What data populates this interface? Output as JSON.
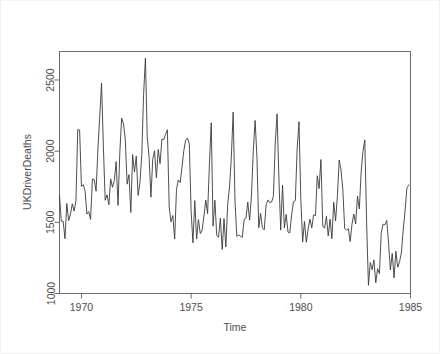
{
  "chart_data": {
    "type": "line",
    "title": "",
    "subtitle": "",
    "xlabel": "Time",
    "ylabel": "UKDriverDeaths",
    "xlim": [
      1969.0,
      1985.0
    ],
    "ylim": [
      1000,
      2700
    ],
    "xticks": [
      1970,
      1975,
      1980,
      1985
    ],
    "xtick_labels": [
      "1970",
      "1975",
      "1980",
      "1985"
    ],
    "yticks": [
      1000,
      1500,
      2000,
      2500
    ],
    "ytick_labels": [
      "1000",
      "1500",
      "2000",
      "2500"
    ],
    "grid": false,
    "legend": null,
    "line_color": "#3a3a3a",
    "frame_color": "#6b6b6b",
    "background_color": "#ffffff",
    "series": [
      {
        "name": "UKDriverDeaths",
        "frequency": "monthly",
        "start": "1969-01",
        "end": "1984-12",
        "n": 192,
        "x": [
          1969.0,
          1969.083,
          1969.167,
          1969.25,
          1969.333,
          1969.417,
          1969.5,
          1969.583,
          1969.667,
          1969.75,
          1969.833,
          1969.917,
          1970.0,
          1970.083,
          1970.167,
          1970.25,
          1970.333,
          1970.417,
          1970.5,
          1970.583,
          1970.667,
          1970.75,
          1970.833,
          1970.917,
          1971.0,
          1971.083,
          1971.167,
          1971.25,
          1971.333,
          1971.417,
          1971.5,
          1971.583,
          1971.667,
          1971.75,
          1971.833,
          1971.917,
          1972.0,
          1972.083,
          1972.167,
          1972.25,
          1972.333,
          1972.417,
          1972.5,
          1972.583,
          1972.667,
          1972.75,
          1972.833,
          1972.917,
          1973.0,
          1973.083,
          1973.167,
          1973.25,
          1973.333,
          1973.417,
          1973.5,
          1973.583,
          1973.667,
          1973.75,
          1973.833,
          1973.917,
          1974.0,
          1974.083,
          1974.167,
          1974.25,
          1974.333,
          1974.417,
          1974.5,
          1974.583,
          1974.667,
          1974.75,
          1974.833,
          1974.917,
          1975.0,
          1975.083,
          1975.167,
          1975.25,
          1975.333,
          1975.417,
          1975.5,
          1975.583,
          1975.667,
          1975.75,
          1975.833,
          1975.917,
          1976.0,
          1976.083,
          1976.167,
          1976.25,
          1976.333,
          1976.417,
          1976.5,
          1976.583,
          1976.667,
          1976.75,
          1976.833,
          1976.917,
          1977.0,
          1977.083,
          1977.167,
          1977.25,
          1977.333,
          1977.417,
          1977.5,
          1977.583,
          1977.667,
          1977.75,
          1977.833,
          1977.917,
          1978.0,
          1978.083,
          1978.167,
          1978.25,
          1978.333,
          1978.417,
          1978.5,
          1978.583,
          1978.667,
          1978.75,
          1978.833,
          1978.917,
          1979.0,
          1979.083,
          1979.167,
          1979.25,
          1979.333,
          1979.417,
          1979.5,
          1979.583,
          1979.667,
          1979.75,
          1979.833,
          1979.917,
          1980.0,
          1980.083,
          1980.167,
          1980.25,
          1980.333,
          1980.417,
          1980.5,
          1980.583,
          1980.667,
          1980.75,
          1980.833,
          1980.917,
          1981.0,
          1981.083,
          1981.167,
          1981.25,
          1981.333,
          1981.417,
          1981.5,
          1981.583,
          1981.667,
          1981.75,
          1981.833,
          1981.917,
          1982.0,
          1982.083,
          1982.167,
          1982.25,
          1982.333,
          1982.417,
          1982.5,
          1982.583,
          1982.667,
          1982.75,
          1982.833,
          1982.917,
          1983.0,
          1983.083,
          1983.167,
          1983.25,
          1983.333,
          1983.417,
          1983.5,
          1983.583,
          1983.667,
          1983.75,
          1983.833,
          1983.917,
          1984.0,
          1984.083,
          1984.167,
          1984.25,
          1984.333,
          1984.417,
          1984.5,
          1984.583,
          1984.667,
          1984.75,
          1984.833,
          1984.917
        ],
        "values": [
          1687,
          1508,
          1507,
          1385,
          1632,
          1511,
          1559,
          1630,
          1579,
          1653,
          2152,
          2148,
          1752,
          1765,
          1717,
          1558,
          1575,
          1520,
          1805,
          1800,
          1719,
          2008,
          2242,
          2478,
          2030,
          1655,
          1693,
          1623,
          1805,
          1746,
          1795,
          1926,
          1619,
          1992,
          2233,
          2192,
          2080,
          1768,
          1835,
          1569,
          1976,
          1853,
          1965,
          1689,
          1778,
          1976,
          2397,
          2654,
          2097,
          1963,
          1677,
          1941,
          2003,
          1813,
          2012,
          1912,
          2084,
          2080,
          2118,
          2150,
          1608,
          1503,
          1548,
          1382,
          1731,
          1798,
          1779,
          1887,
          2004,
          2077,
          2092,
          2051,
          1577,
          1356,
          1652,
          1382,
          1519,
          1421,
          1442,
          1543,
          1656,
          1561,
          1905,
          2199,
          1473,
          1655,
          1407,
          1395,
          1530,
          1309,
          1526,
          1327,
          1627,
          1748,
          1958,
          2274,
          1648,
          1401,
          1411,
          1403,
          1394,
          1520,
          1528,
          1643,
          1515,
          1685,
          2000,
          2215,
          1956,
          1462,
          1563,
          1459,
          1446,
          1622,
          1657,
          1638,
          1643,
          1683,
          2050,
          2262,
          1813,
          1445,
          1762,
          1461,
          1556,
          1431,
          1427,
          1554,
          1645,
          1653,
          2016,
          2207,
          1665,
          1361,
          1506,
          1360,
          1453,
          1522,
          1460,
          1552,
          1548,
          1827,
          1737,
          1941,
          1474,
          1458,
          1542,
          1404,
          1522,
          1385,
          1641,
          1510,
          1681,
          1938,
          1868,
          1726,
          1456,
          1445,
          1456,
          1365,
          1487,
          1558,
          1488,
          1684,
          1594,
          1850,
          1998,
          2079,
          1494,
          1057,
          1218,
          1168,
          1236,
          1076,
          1174,
          1139,
          1427,
          1487,
          1483,
          1513,
          1357,
          1165,
          1282,
          1110,
          1297,
          1185,
          1222,
          1284,
          1444,
          1575,
          1737,
          1763
        ]
      }
    ]
  },
  "axes": {
    "ylabel": "UKDriverDeaths",
    "xlabel": "Time"
  }
}
